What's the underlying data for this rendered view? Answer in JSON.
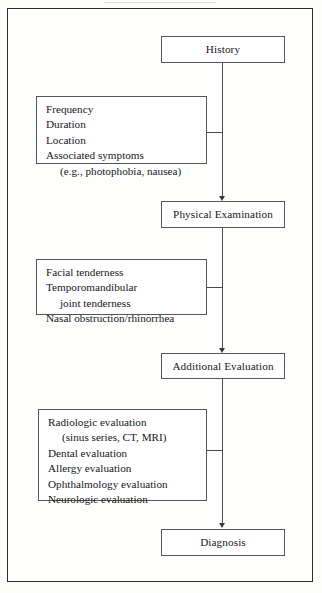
{
  "diagram": {
    "orientation": "vertical",
    "frame_color": "#2b2b2b",
    "line_color": "#4a4a4f",
    "nodes": [
      {
        "id": "history",
        "label": "History"
      },
      {
        "id": "physical-examination",
        "label": "Physical Examination"
      },
      {
        "id": "additional-evaluation",
        "label": "Additional Evaluation"
      },
      {
        "id": "diagnosis",
        "label": "Diagnosis"
      }
    ],
    "detail_boxes": [
      {
        "id": "history-details",
        "attached_to": "history",
        "lines": [
          {
            "text": "Frequency",
            "indent": false
          },
          {
            "text": "Duration",
            "indent": false
          },
          {
            "text": "Location",
            "indent": false
          },
          {
            "text": "Associated symptoms",
            "indent": false
          },
          {
            "text": "(e.g., photophobia, nausea)",
            "indent": true
          }
        ]
      },
      {
        "id": "physical-examination-details",
        "attached_to": "physical-examination",
        "lines": [
          {
            "text": "Facial tenderness",
            "indent": false
          },
          {
            "text": "Temporomandibular",
            "indent": false
          },
          {
            "text": "joint tenderness",
            "indent": true
          },
          {
            "text": "Nasal obstruction/rhinorrhea",
            "indent": false
          }
        ]
      },
      {
        "id": "additional-evaluation-details",
        "attached_to": "additional-evaluation",
        "lines": [
          {
            "text": "Radiologic evaluation",
            "indent": false
          },
          {
            "text": "(sinus series, CT, MRI)",
            "indent": true
          },
          {
            "text": "Dental evaluation",
            "indent": false
          },
          {
            "text": "Allergy evaluation",
            "indent": false
          },
          {
            "text": "Ophthalmology evaluation",
            "indent": false
          },
          {
            "text": "Neurologic evaluation",
            "indent": false
          }
        ]
      }
    ]
  }
}
